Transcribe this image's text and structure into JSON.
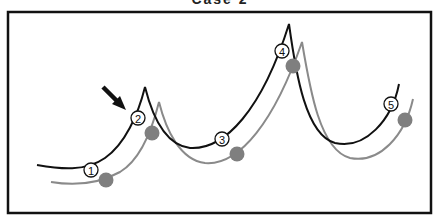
{
  "title": "Case 2",
  "colors": {
    "frame": "#111111",
    "primary_curve": "#111111",
    "secondary_curve": "#8a8a8a",
    "dot": "#7f7f7f",
    "arrow": "#111111"
  },
  "markers": [
    {
      "label": "1",
      "x": 91,
      "y": 170
    },
    {
      "label": "2",
      "x": 138,
      "y": 118
    },
    {
      "label": "3",
      "x": 222,
      "y": 139
    },
    {
      "label": "4",
      "x": 282,
      "y": 51
    },
    {
      "label": "5",
      "x": 391,
      "y": 104
    }
  ],
  "dots": [
    {
      "x": 106,
      "y": 180
    },
    {
      "x": 152,
      "y": 133
    },
    {
      "x": 237,
      "y": 154
    },
    {
      "x": 293,
      "y": 66
    },
    {
      "x": 405,
      "y": 120
    }
  ],
  "arrow": {
    "from": [
      103,
      87
    ],
    "to": [
      124,
      108
    ],
    "points_to": "marker-2"
  }
}
